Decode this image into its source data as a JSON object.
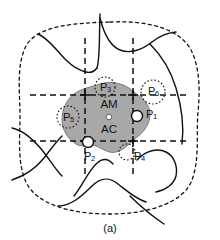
{
  "figure": {
    "caption": "(a)",
    "region_labels": {
      "am": "AM",
      "ac": "AC"
    },
    "points": [
      {
        "id": "P1",
        "label": "P",
        "sub": "1",
        "cx": 137,
        "cy": 116,
        "r": 5.5,
        "marker": "solid-filled",
        "label_x": 146,
        "label_y": 115
      },
      {
        "id": "P2",
        "label": "P",
        "sub": "2",
        "cx": 88,
        "cy": 142,
        "r": 5.5,
        "marker": "solid-filled",
        "label_x": 84,
        "label_y": 157
      },
      {
        "id": "P3",
        "label": "P",
        "sub": "3",
        "cx": 105,
        "cy": 87,
        "r": 10,
        "marker": "dotted-open",
        "label_x": 105,
        "label_y": 88
      },
      {
        "id": "P4",
        "label": "P",
        "sub": "4",
        "cx": 127,
        "cy": 152,
        "r": 8,
        "marker": "dotted-open",
        "label_x": 134,
        "label_y": 157
      },
      {
        "id": "P5",
        "label": "P",
        "sub": "5",
        "cx": 68,
        "cy": 117,
        "r": 11,
        "marker": "dotted-open",
        "label_x": 68,
        "label_y": 118
      },
      {
        "id": "P6",
        "label": "P",
        "sub": "6",
        "cx": 153,
        "cy": 92,
        "r": 12,
        "marker": "dotted-open",
        "label_x": 153,
        "label_y": 92
      }
    ],
    "colors": {
      "blob_fill": "#a8a8a8",
      "blob_stroke": "#7a7a7a",
      "line": "#111111",
      "background": "#ffffff"
    },
    "grid": {
      "v_left_x": 85,
      "v_right_x": 133,
      "h_top_y": 95,
      "h_bottom_y": 141
    }
  }
}
